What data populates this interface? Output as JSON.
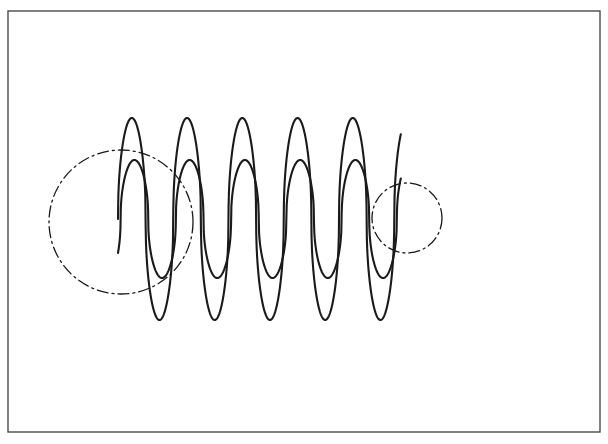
{
  "figure": {
    "background_color": "#ffffff",
    "stroke_color": "#1a1a1a",
    "frame": {
      "name": "figure-frame",
      "x": 8,
      "y": 11,
      "width": 592,
      "height": 421,
      "stroke_color": "#4a4a4a",
      "stroke_width": 1.4,
      "fill": "none"
    }
  },
  "chart_data": {
    "type": "line",
    "title": "",
    "subtitle": "",
    "xlabel": "",
    "ylabel": "",
    "grid": false,
    "legend_position": "none",
    "axes_visible": false,
    "tick_labels_x": [],
    "tick_labels_y": [],
    "xlim": [
      118,
      401
    ],
    "ylim": [
      118,
      322
    ],
    "peak_shape": "sharpened-sine (|sin|^0.45 cusped peaks)",
    "cycles": 5,
    "period_px": 55.25,
    "baseline_y_px": 219,
    "start_x_px": 118,
    "end_x_px": 401,
    "series": [
      {
        "name": "outer-wave",
        "stroke_color": "#1a1a1a",
        "stroke_width": 2.1,
        "amplitude_px": 101,
        "peak_y_px": 118,
        "valley_y_px": 320,
        "phase_offset_px": 0,
        "peaks_x_px": [
          136,
          191,
          246,
          301,
          357
        ],
        "valleys_x_px": [
          163,
          218,
          274,
          329,
          384
        ],
        "peaks_y_px": [
          118,
          118,
          118,
          118,
          118
        ],
        "valleys_y_px": [
          320,
          320,
          320,
          320,
          320
        ]
      },
      {
        "name": "inner-wave",
        "stroke_color": "#1a1a1a",
        "stroke_width": 2.1,
        "amplitude_px": 59,
        "peak_y_px": 160,
        "valley_y_px": 277,
        "phase_offset_px": 2.6,
        "peaks_x_px": [
          139,
          194,
          249,
          304,
          359
        ],
        "valleys_x_px": [
          166,
          221,
          276,
          331,
          386
        ],
        "peaks_y_px": [
          160,
          160,
          160,
          160,
          160
        ],
        "valleys_y_px": [
          277,
          277,
          277,
          277,
          277
        ]
      }
    ],
    "annotations": [
      {
        "name": "left-highlight-circle",
        "shape": "circle",
        "cx_px": 121,
        "cy_px": 222,
        "r_px": 72,
        "line_style": "dash-dot",
        "stroke_color": "#1a1a1a",
        "stroke_width": 1.3,
        "label": ""
      },
      {
        "name": "right-highlight-circle",
        "shape": "circle",
        "cx_px": 407,
        "cy_px": 218,
        "r_px": 35,
        "line_style": "dash-dot",
        "stroke_color": "#1a1a1a",
        "stroke_width": 1.3,
        "label": ""
      }
    ]
  }
}
